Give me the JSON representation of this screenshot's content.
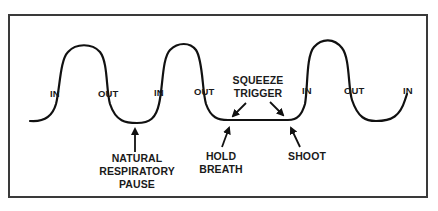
{
  "diagram": {
    "type": "breathing-cycle-waveform",
    "frame_color": "#3a3a3a",
    "line_color": "#111111",
    "phase_labels": [
      {
        "id": "in-1",
        "text": "IN"
      },
      {
        "id": "out-1",
        "text": "OUT"
      },
      {
        "id": "in-2",
        "text": "IN"
      },
      {
        "id": "out-2",
        "text": "OUT"
      },
      {
        "id": "in-3",
        "text": "IN"
      },
      {
        "id": "out-3",
        "text": "OUT"
      },
      {
        "id": "in-4",
        "text": "IN"
      }
    ],
    "annotations": {
      "natural_pause": {
        "line1": "NATURAL",
        "line2": "RESPIRATORY",
        "line3": "PAUSE"
      },
      "squeeze_trigger": {
        "line1": "SQUEEZE",
        "line2": "TRIGGER"
      },
      "hold_breath": {
        "line1": "HOLD",
        "line2": "BREATH"
      },
      "shoot": {
        "line1": "SHOOT"
      }
    }
  }
}
